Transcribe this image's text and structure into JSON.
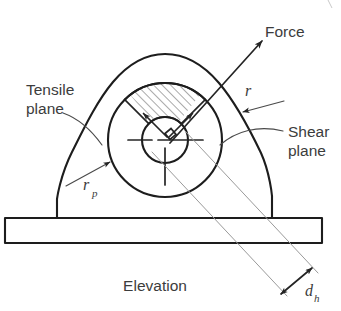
{
  "figure": {
    "caption": "Elevation",
    "type": "engineering-elevation-diagram"
  },
  "labels": {
    "force": "Force",
    "tensile_plane_line1": "Tensile",
    "tensile_plane_line2": "plane",
    "shear_plane_line1": "Shear",
    "shear_plane_line2": "plane",
    "radius_outer": "r",
    "radius_pad_sym": "r",
    "radius_pad_sub": "p",
    "hole_dia_sym": "d",
    "hole_dia_sub": "h"
  },
  "colors": {
    "background": "#ffffff",
    "line_main": "#1d1d1d",
    "line_faint": "#9a9a9a",
    "text": "#3c3c3c",
    "hatch": "#8d8d8d"
  },
  "geometry": {
    "pad_center_x": 165,
    "pad_center_y": 140,
    "pad_radius": 57,
    "hole_radius": 23,
    "baseplate": {
      "x": 5,
      "y": 218,
      "width": 317,
      "height": 25
    },
    "force_angle_deg": 45
  }
}
